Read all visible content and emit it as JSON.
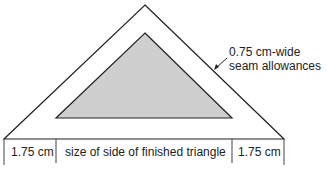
{
  "diagram": {
    "annotation": {
      "line1": "0.75 cm-wide",
      "line2": "seam allowances"
    },
    "dimensions": {
      "left": "1.75 cm",
      "center": "size of side of finished triangle",
      "right": "1.75 cm"
    },
    "colors": {
      "outline": "#222222",
      "finished_fill": "#cfcfcf",
      "background": "#ffffff"
    }
  }
}
